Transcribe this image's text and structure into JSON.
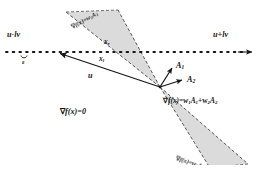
{
  "figure": {
    "background": "#ffffff",
    "ink": "#161616",
    "cone_fill": "#d9d9d9",
    "cone_stroke": "#3a3a3a"
  },
  "axis": {
    "left_label": "u-lv",
    "right_label": "u+lv",
    "epsilon_label": "ε",
    "dot_count": 36,
    "y": 52
  },
  "points": {
    "x_r": {
      "base": "x",
      "sub": "r"
    },
    "x_l": {
      "base": "x",
      "sub": "l"
    }
  },
  "vectors": {
    "u": "u",
    "a1": {
      "base": "A",
      "sub": "1"
    },
    "a2": {
      "base": "A",
      "sub": "2"
    }
  },
  "equations": {
    "upper_cone": "∇f(x)=w₁A₁",
    "lower_cone": "∇f(x)=w₂A₂",
    "combination": "∇f(x)=w₁A₁+w₂A₂",
    "stationary": "∇f(x)=0"
  },
  "equation_parts": {
    "upper_nabla": "∇",
    "upper_rest": "f(x)=w",
    "upper_sub1": "1",
    "upper_A": "A",
    "upper_sub2": "1",
    "lower_nabla": "∇",
    "lower_rest": "f(x)=w",
    "lower_sub1": "2",
    "lower_A": "A",
    "lower_sub2": "2",
    "comb_nabla": "∇",
    "comb_f": "f(x)=w",
    "comb_s1": "1",
    "comb_A1": "A",
    "comb_s2": "1",
    "comb_plus": "+w",
    "comb_s3": "2",
    "comb_A2": "A",
    "comb_s4": "2",
    "stat_nabla": "∇",
    "stat_rest": "f(x)=0"
  }
}
